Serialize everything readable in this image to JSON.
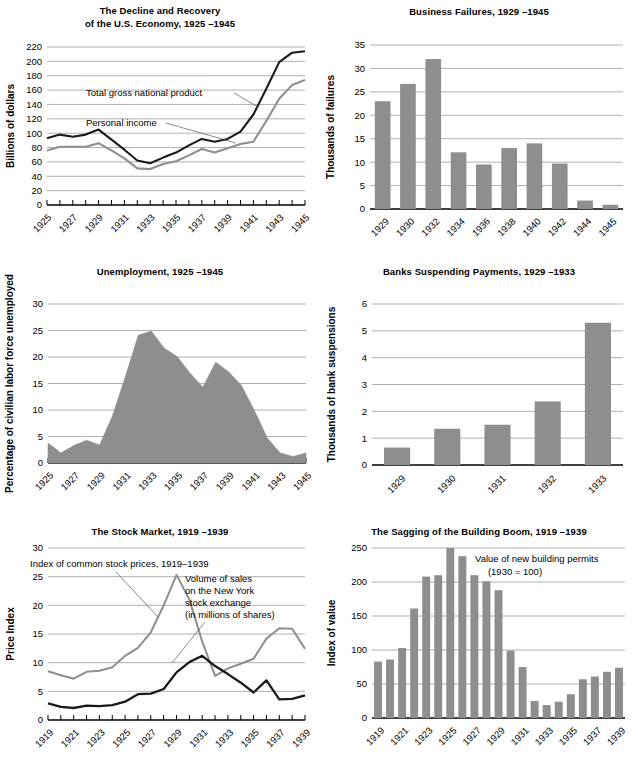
{
  "figure": {
    "panels": [
      {
        "id": "gnp",
        "title_lines": [
          "The Decline and Recovery",
          "of the U.S. Economy, 1925 –1945"
        ]
      },
      {
        "id": "failures",
        "title_lines": [
          "Business Failures, 1929 –1945"
        ]
      },
      {
        "id": "unemployment",
        "title_lines": [
          "Unemployment, 1925 –1945"
        ]
      },
      {
        "id": "banks",
        "title_lines": [
          "Banks Suspending Payments, 1929 –1933"
        ]
      },
      {
        "id": "stocks",
        "title_lines": [
          "The Stock Market, 1919 –1939"
        ]
      },
      {
        "id": "building",
        "title_lines": [
          "The Sagging of the Building Boom, 1919 –1939"
        ]
      }
    ]
  },
  "chart_data": [
    {
      "id": "gnp",
      "type": "line",
      "title": "The Decline and Recovery of the U.S. Economy, 1925 –1945",
      "xlabel": "",
      "ylabel": "Billions of dollars",
      "ylim": [
        0,
        220
      ],
      "yticks": [
        0,
        20,
        40,
        60,
        80,
        100,
        120,
        140,
        160,
        180,
        200,
        220
      ],
      "grid": true,
      "x": [
        1925,
        1926,
        1927,
        1928,
        1929,
        1930,
        1931,
        1932,
        1933,
        1934,
        1935,
        1936,
        1937,
        1938,
        1939,
        1940,
        1941,
        1942,
        1943,
        1944,
        1945
      ],
      "xtick_labels": [
        "1925",
        "1927",
        "1929",
        "1931",
        "1933",
        "1935",
        "1937",
        "1939",
        "1941",
        "1943",
        "1945"
      ],
      "series": [
        {
          "name": "Total gross national product",
          "color": "#1a1a1a",
          "values": [
            93,
            98,
            95,
            98,
            105,
            91,
            77,
            62,
            58,
            66,
            73,
            83,
            92,
            88,
            92,
            102,
            126,
            162,
            199,
            212,
            214
          ]
        },
        {
          "name": "Personal income",
          "color": "#8e8e8e",
          "values": [
            76,
            81,
            81,
            81,
            86,
            76,
            65,
            51,
            50,
            57,
            61,
            69,
            78,
            73,
            79,
            85,
            88,
            117,
            148,
            167,
            174
          ]
        }
      ],
      "annotations": [
        {
          "text": "Total gross national product",
          "points_to": 1941
        },
        {
          "text": "Personal income",
          "points_to": 1941
        }
      ]
    },
    {
      "id": "failures",
      "type": "bar",
      "title": "Business Failures, 1929 –1945",
      "xlabel": "",
      "ylabel": "Thousands of failures",
      "ylim": [
        0,
        35
      ],
      "yticks": [
        0,
        5,
        10,
        15,
        20,
        25,
        30,
        35
      ],
      "grid": true,
      "bar_color": "#8e8e8e",
      "categories": [
        "1929",
        "1930",
        "1932",
        "1934",
        "1936",
        "1938",
        "1940",
        "1942",
        "1944",
        "1945"
      ],
      "values": [
        23.0,
        26.7,
        32.0,
        12.1,
        9.5,
        13.0,
        14.0,
        9.7,
        1.8,
        0.9
      ]
    },
    {
      "id": "unemployment",
      "type": "area",
      "title": "Unemployment, 1925 –1945",
      "xlabel": "",
      "ylabel": "Percentage of civilian labor force unemployed",
      "ylim": [
        0,
        30
      ],
      "yticks": [
        0,
        5,
        10,
        15,
        20,
        25,
        30
      ],
      "grid": true,
      "fill_color": "#8e8e8e",
      "x": [
        1925,
        1926,
        1927,
        1928,
        1929,
        1930,
        1931,
        1932,
        1933,
        1934,
        1935,
        1936,
        1937,
        1938,
        1939,
        1940,
        1941,
        1942,
        1943,
        1944,
        1945
      ],
      "xtick_labels": [
        "1925",
        "1927",
        "1929",
        "1931",
        "1933",
        "1935",
        "1937",
        "1939",
        "1941",
        "1943",
        "1945"
      ],
      "values": [
        3.8,
        1.9,
        3.3,
        4.3,
        3.4,
        8.9,
        16.3,
        24.1,
        24.9,
        21.7,
        20.1,
        17.0,
        14.3,
        19.0,
        17.2,
        14.6,
        9.9,
        4.7,
        1.9,
        1.2,
        1.9
      ]
    },
    {
      "id": "banks",
      "type": "bar",
      "title": "Banks Suspending Payments, 1929 –1933",
      "xlabel": "",
      "ylabel": "Thousands of bank suspensions",
      "ylim": [
        0,
        6
      ],
      "yticks": [
        0,
        1,
        2,
        3,
        4,
        5,
        6
      ],
      "grid": true,
      "bar_color": "#8e8e8e",
      "categories": [
        "1929",
        "1930",
        "1931",
        "1932",
        "1933"
      ],
      "values": [
        0.65,
        1.35,
        1.5,
        2.37,
        5.3
      ]
    },
    {
      "id": "stocks",
      "type": "line",
      "title": "The Stock Market, 1919 –1939",
      "xlabel": "",
      "ylabel": "Price Index",
      "ylim": [
        0,
        30
      ],
      "yticks": [
        0,
        5,
        10,
        15,
        20,
        25,
        30
      ],
      "grid": true,
      "x": [
        1919,
        1920,
        1921,
        1922,
        1923,
        1924,
        1925,
        1926,
        1927,
        1928,
        1929,
        1930,
        1931,
        1932,
        1933,
        1934,
        1935,
        1936,
        1937,
        1938,
        1939
      ],
      "xtick_labels": [
        "1919",
        "1921",
        "1923",
        "1925",
        "1927",
        "1929",
        "1931",
        "1933",
        "1935",
        "1937",
        "1939"
      ],
      "series": [
        {
          "name": "Index of common stock prices, 1919–1939",
          "color": "#8e8e8e",
          "values": [
            8.5,
            7.8,
            7.2,
            8.4,
            8.6,
            9.2,
            11.2,
            12.6,
            15.3,
            20.0,
            25.3,
            21.0,
            13.7,
            7.7,
            9.0,
            9.8,
            10.7,
            14.2,
            16.0,
            15.9,
            12.4,
            12.6
          ]
        },
        {
          "name": "Volume of sales on the New York stock exchange (in millions of shares)",
          "color": "#1a1a1a",
          "values": [
            2.9,
            2.3,
            2.1,
            2.5,
            2.4,
            2.6,
            3.2,
            4.5,
            4.6,
            5.4,
            8.3,
            10.1,
            11.2,
            9.4,
            8.0,
            6.5,
            4.8,
            6.9,
            3.6,
            3.7,
            4.3,
            5.0
          ]
        }
      ],
      "annotations": [
        {
          "text": "Index of common stock prices, 1919–1939"
        },
        {
          "text": "Volume of sales"
        },
        {
          "text": "on the New York"
        },
        {
          "text": "stock exchange"
        },
        {
          "text": "(in millions of shares)"
        }
      ]
    },
    {
      "id": "building",
      "type": "bar",
      "title": "The Sagging of the Building Boom, 1919 –1939",
      "xlabel": "",
      "ylabel": "Index of value",
      "ylim": [
        0,
        250
      ],
      "yticks": [
        0,
        50,
        100,
        150,
        200,
        250
      ],
      "grid": true,
      "bar_color": "#8e8e8e",
      "categories": [
        "1919",
        "1920",
        "1921",
        "1922",
        "1923",
        "1924",
        "1925",
        "1926",
        "1927",
        "1928",
        "1929",
        "1930",
        "1931",
        "1932",
        "1933",
        "1934",
        "1935",
        "1936",
        "1937",
        "1938",
        "1939"
      ],
      "xtick_labels": [
        "1919",
        "1921",
        "1923",
        "1925",
        "1927",
        "1929",
        "1931",
        "1933",
        "1935",
        "1937",
        "1939"
      ],
      "values": [
        83,
        86,
        103,
        161,
        208,
        210,
        250,
        238,
        210,
        201,
        188,
        99,
        75,
        25,
        19,
        24,
        35,
        57,
        61,
        68,
        74
      ],
      "annotation_lines": [
        "Value of new building permits",
        "(1930 = 100)"
      ]
    }
  ]
}
